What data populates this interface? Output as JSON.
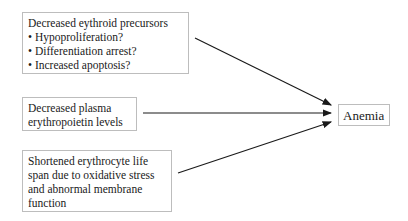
{
  "diagram": {
    "causes": [
      {
        "title": "Decreased eythroid precursors",
        "bullets": [
          "• Hypoproliferation?",
          "• Differentiation arrest?",
          "• Increased apoptosis?"
        ]
      },
      {
        "lines": [
          "Decreased plasma",
          "erythropoietin levels"
        ]
      },
      {
        "lines": [
          "Shortened erythrocyte life",
          "span due to oxidative stress",
          "and abnormal membrane",
          "function"
        ]
      }
    ],
    "outcome": "Anemia",
    "colors": {
      "arrow": "#1a1a1a",
      "box_border": "#bdbdbd"
    }
  }
}
